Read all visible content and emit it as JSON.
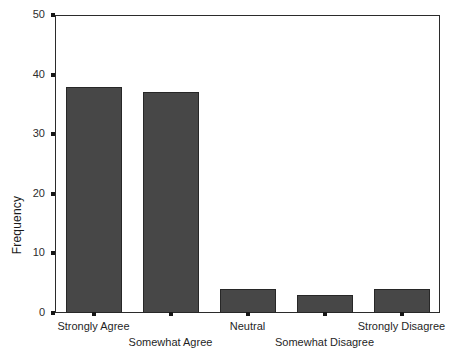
{
  "chart_data": {
    "type": "bar",
    "title": "",
    "subtitle": "",
    "xlabel": "",
    "ylabel": "Frequency",
    "categories": [
      "Strongly Agree",
      "Somewhat Agree",
      "Neutral",
      "Somewhat Disagree",
      "Strongly Disagree"
    ],
    "values": [
      38,
      37,
      4,
      3,
      4
    ],
    "ylim": [
      0,
      50
    ],
    "yticks": [
      0,
      10,
      20,
      30,
      40,
      50
    ],
    "ytick_labels": [
      "0",
      "10",
      "20",
      "30",
      "40",
      "50"
    ],
    "grid": false,
    "legend": false,
    "legend_position": "none",
    "bar_color": "#474747",
    "bar_edge_color": "#272727",
    "axis_color": "#2b2b2b",
    "background_color": "#ffffff",
    "xtick_label_rows": [
      0,
      1,
      0,
      1,
      0
    ],
    "annotations": []
  },
  "axes": {
    "y_title": "Frequency"
  }
}
